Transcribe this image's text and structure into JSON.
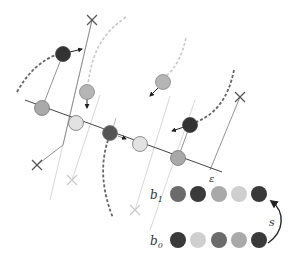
{
  "diagram": {
    "line_label": "ε",
    "colors": {
      "dark": "#3a3a3a",
      "mid_dark": "#6b6b6b",
      "mid": "#a9a9a9",
      "light": "#d4d4d4",
      "faint": "#cfcfcf",
      "stroke": "#555555"
    },
    "line_circles": [
      {
        "x": 42,
        "y": 108,
        "shade": "mid"
      },
      {
        "x": 76,
        "y": 123,
        "shade": "light"
      },
      {
        "x": 110,
        "y": 133,
        "shade": "dark"
      },
      {
        "x": 140,
        "y": 144,
        "shade": "light"
      },
      {
        "x": 178,
        "y": 158,
        "shade": "mid"
      }
    ],
    "free_circles": [
      {
        "x": 63,
        "y": 54,
        "shade": "dark"
      },
      {
        "x": 87,
        "y": 92,
        "shade": "mid"
      },
      {
        "x": 163,
        "y": 82,
        "shade": "mid"
      },
      {
        "x": 190,
        "y": 125,
        "shade": "dark"
      }
    ],
    "x_markers": [
      {
        "x": 92,
        "y": 20,
        "tone": "dark"
      },
      {
        "x": 37,
        "y": 165,
        "tone": "dark"
      },
      {
        "x": 240,
        "y": 97,
        "tone": "dark"
      },
      {
        "x": 72,
        "y": 180,
        "tone": "light"
      },
      {
        "x": 135,
        "y": 210,
        "tone": "light"
      }
    ]
  },
  "beads": {
    "rows": [
      {
        "label_base": "b",
        "label_sub": "1",
        "y": 194,
        "shades": [
          "mid_dark",
          "dark",
          "mid",
          "light",
          "dark"
        ]
      },
      {
        "label_base": "b",
        "label_sub": "0",
        "y": 240,
        "shades": [
          "dark",
          "light",
          "mid_dark",
          "mid",
          "dark"
        ]
      }
    ],
    "arrow_label": "s"
  }
}
